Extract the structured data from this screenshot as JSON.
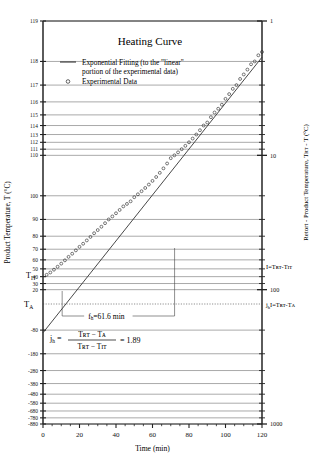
{
  "figure": {
    "title": "Heating Curve",
    "xlabel": "Time (min)",
    "ylabel_left": "Product Temperature, T  (°C)",
    "ylabel_right": "Retort - Product Temperature, Tʀᴛ - T  (°C)"
  },
  "legend": {
    "line_label_1": "Exponential Fitting (to the \"linear\"",
    "line_label_2": "portion of the experimental data)",
    "marker_label": "Experimental Data",
    "line_symbol": "line-segment-icon",
    "marker_symbol": "open-circle-icon"
  },
  "annotations": {
    "t_it": "T",
    "t_it_sub": "IT",
    "t_a": "T",
    "t_a_sub": "A",
    "fh": "f",
    "fh_sub": "h",
    "fh_value": "=61.6 min",
    "jh": "j",
    "jh_sub": "h",
    "jh_eq_equals": "=",
    "jh_num": "Tʀᴛ − Tᴀ",
    "jh_den": "Tʀᴛ − Tɪᴛ",
    "jh_result": "= 1.89",
    "right_I": "I=Tʀᴛ-Tɪᴛ",
    "right_jhI": "I=Tʀᴛ-Tᴀ",
    "right_jhI_pre": "j",
    "right_jhI_sub": "h"
  },
  "chart_data": {
    "type": "line",
    "title": "Heating Curve",
    "xlabel": "Time (min)",
    "ylabel": "Product Temperature, T (°C)",
    "ylabel_secondary": "Retort - Product Temperature, TRT - T (°C)",
    "xlim": [
      0,
      120
    ],
    "xticks": [
      0,
      20,
      40,
      60,
      80,
      100,
      120
    ],
    "x_minor_step": 5,
    "grid": true,
    "legend_position": "upper-left-inside",
    "y_axis_type": "inverted-log-of-(TRT - T)",
    "T_RT": 120,
    "left_axis_ticks": [
      119,
      118,
      117,
      116,
      115,
      114,
      113,
      112,
      111,
      110,
      100,
      90,
      80,
      70,
      60,
      50,
      40,
      30,
      20,
      -80,
      -180,
      -280,
      -380,
      -480,
      -580,
      -680,
      -780,
      -880
    ],
    "left_axis_labeled": [
      "119",
      "118",
      "117",
      "116",
      "115",
      "114",
      "113",
      "112",
      "111",
      "110",
      "100",
      "90",
      "80",
      "70",
      "60",
      "50",
      "40",
      "30",
      "20",
      "-80",
      "-180",
      "-280",
      "-380",
      "-480",
      "-580",
      "-680",
      "-780",
      "-880"
    ],
    "right_axis_decades": [
      "1",
      "10",
      "100",
      "1000"
    ],
    "right_axis_range": [
      1,
      1000
    ],
    "parameters": {
      "fh_min": 61.6,
      "jh": 1.89,
      "T_IT": 41,
      "T_A": 43.6
    },
    "series": [
      {
        "name": "Exponential Fitting (to the \"linear\" portion of the experimental data)",
        "type": "line",
        "x": [
          0,
          120
        ],
        "y_TRT_minus_T": [
          209.3,
          1.86
        ]
      },
      {
        "name": "Experimental Data",
        "type": "scatter-open-circle",
        "x": [
          2,
          4,
          6,
          8,
          10,
          12,
          14,
          16,
          18,
          20,
          22,
          24,
          26,
          28,
          30,
          32,
          34,
          36,
          38,
          40,
          42,
          44,
          46,
          48,
          50,
          52,
          54,
          56,
          58,
          60,
          62,
          64,
          66,
          68,
          70,
          72,
          74,
          76,
          78,
          80,
          82,
          84,
          86,
          88,
          90,
          92,
          94,
          96,
          98,
          100,
          102,
          104,
          106,
          108,
          110,
          112,
          114,
          116,
          118,
          120
        ],
        "y_product_temp": [
          42.5,
          45.5,
          49.0,
          52.5,
          56.0,
          59.5,
          63.0,
          66.0,
          69.0,
          72.0,
          74.5,
          77.0,
          79.5,
          82.0,
          84.0,
          86.0,
          88.0,
          90.0,
          91.5,
          93.0,
          94.5,
          96.0,
          97.0,
          98.0,
          99.5,
          100.5,
          101.5,
          102.5,
          103.5,
          104.5,
          105.5,
          106.5,
          107.5,
          108.5,
          109.5,
          110.0,
          110.5,
          111.0,
          111.5,
          112.0,
          112.5,
          113.0,
          113.5,
          114.0,
          114.3,
          114.8,
          115.2,
          115.5,
          115.8,
          116.2,
          116.5,
          116.8,
          117.0,
          117.3,
          117.5,
          117.7,
          117.9,
          118.0,
          118.2,
          118.3
        ]
      }
    ]
  }
}
